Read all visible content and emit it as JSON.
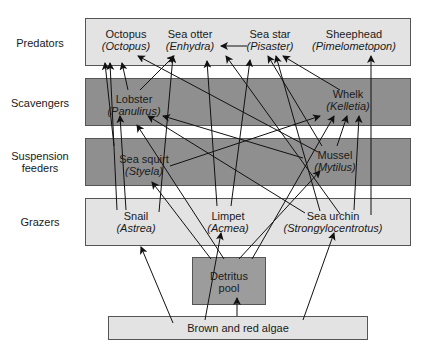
{
  "rows": [
    {
      "label": "Predators"
    },
    {
      "label": "Scavengers"
    },
    {
      "label": "Suspension feeders"
    },
    {
      "label": "Grazers"
    }
  ],
  "nodes": {
    "octopus": {
      "common": "Octopus",
      "sci": "(Octopus)"
    },
    "sea_otter": {
      "common": "Sea otter",
      "sci": "(Enhydra)"
    },
    "sea_star": {
      "common": "Sea star",
      "sci": "(Pisaster)"
    },
    "sheephead": {
      "common": "Sheephead",
      "sci": "(Pimelometopon)"
    },
    "lobster": {
      "common": "Lobster",
      "sci": "(Panulirus)"
    },
    "whelk": {
      "common": "Whelk",
      "sci": "(Kelletia)"
    },
    "sea_squirt": {
      "common": "Sea squirt",
      "sci": "(Styela)"
    },
    "mussel": {
      "common": "Mussel",
      "sci": "(Mytilus)"
    },
    "snail": {
      "common": "Snail",
      "sci": "(Astrea)"
    },
    "limpet": {
      "common": "Limpet",
      "sci": "(Acmea)"
    },
    "sea_urchin": {
      "common": "Sea urchin",
      "sci": "(Strongylocentrotus)"
    },
    "detritus": {
      "line1": "Detritus",
      "line2": "pool"
    },
    "algae": {
      "label": "Brown and red algae"
    }
  },
  "edges": [
    [
      "algae",
      "snail"
    ],
    [
      "algae",
      "limpet"
    ],
    [
      "algae",
      "detritus"
    ],
    [
      "algae",
      "sea_urchin"
    ],
    [
      "detritus",
      "sea_squirt"
    ],
    [
      "detritus",
      "mussel"
    ],
    [
      "detritus",
      "whelk"
    ],
    [
      "detritus",
      "lobster"
    ],
    [
      "snail",
      "octopus"
    ],
    [
      "snail",
      "lobster"
    ],
    [
      "snail",
      "sea_otter"
    ],
    [
      "limpet",
      "lobster"
    ],
    [
      "limpet",
      "sea_star"
    ],
    [
      "sea_urchin",
      "sea_otter"
    ],
    [
      "sea_urchin",
      "sea_star"
    ],
    [
      "sea_urchin",
      "lobster"
    ],
    [
      "sea_urchin",
      "whelk"
    ],
    [
      "sea_urchin",
      "sheephead"
    ],
    [
      "sea_squirt",
      "octopus"
    ],
    [
      "sea_squirt",
      "whelk"
    ],
    [
      "mussel",
      "octopus"
    ],
    [
      "mussel",
      "sea_star"
    ],
    [
      "mussel",
      "whelk"
    ],
    [
      "mussel",
      "lobster"
    ],
    [
      "lobster",
      "octopus"
    ],
    [
      "lobster",
      "sea_otter"
    ],
    [
      "whelk",
      "sea_star"
    ],
    [
      "sea_star",
      "sea_otter"
    ]
  ],
  "colors": {
    "light_band": "#e3e3e3",
    "dark_band": "#8f8f8f",
    "line": "#111111"
  }
}
